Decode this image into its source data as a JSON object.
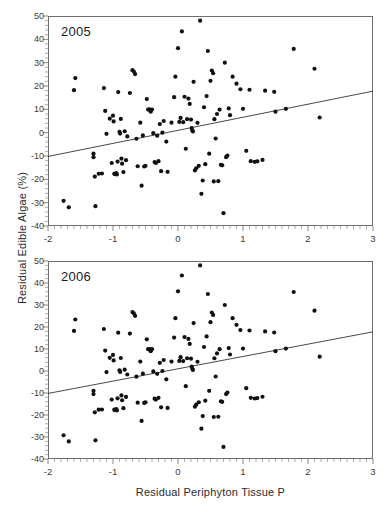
{
  "figure": {
    "axis_x_title": "Residual Periphyton Tissue P",
    "axis_y_title": "Residual Edible Algae (%)",
    "background_color": "#ffffff",
    "marker_color": "#111111",
    "line_color": "#333333",
    "frame_color": "#6e6e6e"
  },
  "chart_data": [
    {
      "type": "scatter",
      "title": "2005",
      "xlabel": "Residual Periphyton Tissue P",
      "ylabel": "Residual Edible Algae (%)",
      "xlim": [
        -2,
        3
      ],
      "ylim": [
        -40,
        50
      ],
      "xticks": [
        -2,
        -1,
        0,
        1,
        2,
        3
      ],
      "yticks": [
        -40,
        -30,
        -20,
        -10,
        0,
        10,
        20,
        30,
        40,
        50
      ],
      "xtick_labels": [
        "-2",
        "-1",
        "0",
        "1",
        "2",
        "3"
      ],
      "ytick_labels": [
        "-40",
        "-30",
        "-20",
        "-10",
        "0",
        "10",
        "20",
        "30",
        "40",
        "50"
      ],
      "grid": false,
      "legend": false,
      "trendline": {
        "x": [
          -2,
          3
        ],
        "y": [
          -10.2,
          17.8
        ]
      },
      "points": [
        [
          -1.76,
          -29.2
        ],
        [
          -1.68,
          -32.0
        ],
        [
          -1.58,
          23.4
        ],
        [
          -1.6,
          18.2
        ],
        [
          -1.3,
          -10.5
        ],
        [
          -1.3,
          -9.0
        ],
        [
          -1.27,
          -31.5
        ],
        [
          -1.28,
          -18.8
        ],
        [
          -1.22,
          -17.6
        ],
        [
          -1.17,
          -17.5
        ],
        [
          -1.14,
          19.1
        ],
        [
          -1.12,
          9.3
        ],
        [
          -1.1,
          -0.5
        ],
        [
          -1.05,
          6.0
        ],
        [
          -1.02,
          -13.0
        ],
        [
          -1.0,
          7.3
        ],
        [
          -0.99,
          4.8
        ],
        [
          -0.98,
          -17.6
        ],
        [
          -0.97,
          -17.8
        ],
        [
          -0.95,
          -17.3
        ],
        [
          -0.94,
          -17.9
        ],
        [
          -0.93,
          -12.4
        ],
        [
          -0.92,
          17.4
        ],
        [
          -0.9,
          0.3
        ],
        [
          -0.89,
          -0.4
        ],
        [
          -0.88,
          5.9
        ],
        [
          -0.87,
          -11.1
        ],
        [
          -0.86,
          -13.3
        ],
        [
          -0.84,
          -16.9
        ],
        [
          -0.82,
          0.6
        ],
        [
          -0.8,
          -11.8
        ],
        [
          -0.78,
          -1.6
        ],
        [
          -0.74,
          17.0
        ],
        [
          -0.7,
          26.8
        ],
        [
          -0.68,
          26.2
        ],
        [
          -0.66,
          25.1
        ],
        [
          -0.64,
          -2.6
        ],
        [
          -0.62,
          -14.4
        ],
        [
          -0.58,
          4.3
        ],
        [
          -0.56,
          -22.7
        ],
        [
          -0.54,
          -1.2
        ],
        [
          -0.52,
          -14.5
        ],
        [
          -0.5,
          -14.2
        ],
        [
          -0.48,
          14.4
        ],
        [
          -0.46,
          9.9
        ],
        [
          -0.44,
          10.0
        ],
        [
          -0.42,
          9.0
        ],
        [
          -0.4,
          9.9
        ],
        [
          -0.38,
          -0.2
        ],
        [
          -0.36,
          -12.6
        ],
        [
          -0.34,
          -13.0
        ],
        [
          -0.32,
          -1.3
        ],
        [
          -0.3,
          -12.2
        ],
        [
          -0.28,
          3.7
        ],
        [
          -0.26,
          -16.5
        ],
        [
          -0.24,
          0.0
        ],
        [
          -0.22,
          5.0
        ],
        [
          -0.18,
          -3.8
        ],
        [
          -0.16,
          -16.8
        ],
        [
          -0.1,
          4.3
        ],
        [
          -0.06,
          15.2
        ],
        [
          -0.04,
          24.0
        ],
        [
          0.0,
          36.2
        ],
        [
          0.02,
          4.6
        ],
        [
          0.04,
          6.3
        ],
        [
          0.06,
          43.4
        ],
        [
          0.08,
          4.5
        ],
        [
          0.1,
          15.4
        ],
        [
          0.12,
          -6.9
        ],
        [
          0.14,
          5.8
        ],
        [
          0.16,
          14.6
        ],
        [
          0.18,
          12.3
        ],
        [
          0.2,
          5.6
        ],
        [
          0.21,
          2.0
        ],
        [
          0.22,
          1.0
        ],
        [
          0.23,
          0.5
        ],
        [
          0.24,
          21.8
        ],
        [
          0.26,
          -16.2
        ],
        [
          0.28,
          -15.3
        ],
        [
          0.3,
          4.2
        ],
        [
          0.32,
          -14.2
        ],
        [
          0.34,
          48.0
        ],
        [
          0.36,
          -26.2
        ],
        [
          0.38,
          -20.5
        ],
        [
          0.4,
          10.9
        ],
        [
          0.42,
          -13.5
        ],
        [
          0.44,
          15.7
        ],
        [
          0.46,
          35.0
        ],
        [
          0.48,
          -9.0
        ],
        [
          0.5,
          22.2
        ],
        [
          0.52,
          26.6
        ],
        [
          0.54,
          25.5
        ],
        [
          0.55,
          -20.9
        ],
        [
          0.56,
          5.8
        ],
        [
          0.58,
          -2.5
        ],
        [
          0.6,
          8.0
        ],
        [
          0.62,
          -20.8
        ],
        [
          0.64,
          9.9
        ],
        [
          0.66,
          -13.8
        ],
        [
          0.68,
          -14.0
        ],
        [
          0.7,
          -34.5
        ],
        [
          0.72,
          30.0
        ],
        [
          0.74,
          -10.5
        ],
        [
          0.76,
          -9.8
        ],
        [
          0.78,
          10.4
        ],
        [
          0.8,
          7.5
        ],
        [
          0.84,
          24.0
        ],
        [
          0.9,
          21.0
        ],
        [
          0.96,
          18.6
        ],
        [
          1.0,
          10.2
        ],
        [
          1.05,
          -7.8
        ],
        [
          1.1,
          18.4
        ],
        [
          1.12,
          -12.2
        ],
        [
          1.18,
          -12.5
        ],
        [
          1.22,
          -12.3
        ],
        [
          1.3,
          -11.7
        ],
        [
          1.34,
          18.0
        ],
        [
          1.48,
          17.5
        ],
        [
          1.5,
          9.0
        ],
        [
          1.66,
          10.2
        ],
        [
          1.78,
          35.9
        ],
        [
          2.1,
          27.4
        ],
        [
          2.18,
          6.5
        ]
      ]
    },
    {
      "type": "scatter",
      "title": "2006",
      "xlabel": "Residual Periphyton Tissue P",
      "ylabel": "Residual Edible Algae (%)",
      "xlim": [
        -2,
        3
      ],
      "ylim": [
        -40,
        50
      ],
      "xticks": [
        -2,
        -1,
        0,
        1,
        2,
        3
      ],
      "yticks": [
        -40,
        -30,
        -20,
        -10,
        0,
        10,
        20,
        30,
        40,
        50
      ],
      "xtick_labels": [
        "-2",
        "-1",
        "0",
        "1",
        "2",
        "3"
      ],
      "ytick_labels": [
        "-40",
        "-30",
        "-20",
        "-10",
        "0",
        "10",
        "20",
        "30",
        "40",
        "50"
      ],
      "grid": false,
      "legend": false,
      "trendline": {
        "x": [
          -2,
          3
        ],
        "y": [
          -10.2,
          17.8
        ]
      },
      "points": [
        [
          -1.76,
          -29.2
        ],
        [
          -1.68,
          -32.0
        ],
        [
          -1.58,
          23.4
        ],
        [
          -1.6,
          18.2
        ],
        [
          -1.3,
          -10.5
        ],
        [
          -1.3,
          -9.0
        ],
        [
          -1.27,
          -31.5
        ],
        [
          -1.28,
          -18.8
        ],
        [
          -1.22,
          -17.6
        ],
        [
          -1.17,
          -17.5
        ],
        [
          -1.14,
          19.1
        ],
        [
          -1.12,
          9.3
        ],
        [
          -1.1,
          -0.5
        ],
        [
          -1.05,
          6.0
        ],
        [
          -1.02,
          -13.0
        ],
        [
          -1.0,
          7.3
        ],
        [
          -0.99,
          4.8
        ],
        [
          -0.98,
          -17.6
        ],
        [
          -0.97,
          -17.8
        ],
        [
          -0.95,
          -17.3
        ],
        [
          -0.94,
          -17.9
        ],
        [
          -0.93,
          -12.4
        ],
        [
          -0.92,
          17.4
        ],
        [
          -0.9,
          0.3
        ],
        [
          -0.89,
          -0.4
        ],
        [
          -0.88,
          5.9
        ],
        [
          -0.87,
          -11.1
        ],
        [
          -0.86,
          -13.3
        ],
        [
          -0.84,
          -16.9
        ],
        [
          -0.82,
          0.6
        ],
        [
          -0.8,
          -11.8
        ],
        [
          -0.78,
          -1.6
        ],
        [
          -0.74,
          17.0
        ],
        [
          -0.7,
          26.8
        ],
        [
          -0.68,
          26.2
        ],
        [
          -0.66,
          25.1
        ],
        [
          -0.64,
          -2.6
        ],
        [
          -0.62,
          -14.4
        ],
        [
          -0.58,
          4.3
        ],
        [
          -0.56,
          -22.7
        ],
        [
          -0.54,
          -1.2
        ],
        [
          -0.52,
          -14.5
        ],
        [
          -0.5,
          -14.2
        ],
        [
          -0.48,
          14.4
        ],
        [
          -0.46,
          9.9
        ],
        [
          -0.44,
          10.0
        ],
        [
          -0.42,
          9.0
        ],
        [
          -0.4,
          9.9
        ],
        [
          -0.38,
          -0.2
        ],
        [
          -0.36,
          -12.6
        ],
        [
          -0.34,
          -13.0
        ],
        [
          -0.32,
          -1.3
        ],
        [
          -0.3,
          -12.2
        ],
        [
          -0.28,
          3.7
        ],
        [
          -0.26,
          -16.5
        ],
        [
          -0.24,
          0.0
        ],
        [
          -0.22,
          5.0
        ],
        [
          -0.18,
          -3.8
        ],
        [
          -0.16,
          -16.8
        ],
        [
          -0.1,
          4.3
        ],
        [
          -0.06,
          15.2
        ],
        [
          -0.04,
          24.0
        ],
        [
          0.0,
          36.2
        ],
        [
          0.02,
          4.6
        ],
        [
          0.04,
          6.3
        ],
        [
          0.06,
          43.4
        ],
        [
          0.08,
          4.5
        ],
        [
          0.1,
          15.4
        ],
        [
          0.12,
          -6.9
        ],
        [
          0.14,
          5.8
        ],
        [
          0.16,
          14.6
        ],
        [
          0.18,
          12.3
        ],
        [
          0.2,
          5.6
        ],
        [
          0.21,
          2.0
        ],
        [
          0.22,
          1.0
        ],
        [
          0.23,
          0.5
        ],
        [
          0.24,
          21.8
        ],
        [
          0.26,
          -16.2
        ],
        [
          0.28,
          -15.3
        ],
        [
          0.3,
          4.2
        ],
        [
          0.32,
          -14.2
        ],
        [
          0.34,
          48.0
        ],
        [
          0.36,
          -26.2
        ],
        [
          0.38,
          -20.5
        ],
        [
          0.4,
          10.9
        ],
        [
          0.42,
          -13.5
        ],
        [
          0.44,
          15.7
        ],
        [
          0.46,
          35.0
        ],
        [
          0.48,
          -9.0
        ],
        [
          0.5,
          22.2
        ],
        [
          0.52,
          26.6
        ],
        [
          0.54,
          25.5
        ],
        [
          0.55,
          -20.9
        ],
        [
          0.56,
          5.8
        ],
        [
          0.58,
          -2.5
        ],
        [
          0.6,
          8.0
        ],
        [
          0.62,
          -20.8
        ],
        [
          0.64,
          9.9
        ],
        [
          0.66,
          -13.8
        ],
        [
          0.68,
          -14.0
        ],
        [
          0.7,
          -34.5
        ],
        [
          0.72,
          30.0
        ],
        [
          0.74,
          -10.5
        ],
        [
          0.76,
          -9.8
        ],
        [
          0.78,
          10.4
        ],
        [
          0.8,
          7.5
        ],
        [
          0.84,
          24.0
        ],
        [
          0.9,
          21.0
        ],
        [
          0.96,
          18.6
        ],
        [
          1.0,
          10.2
        ],
        [
          1.05,
          -7.8
        ],
        [
          1.1,
          18.4
        ],
        [
          1.12,
          -12.2
        ],
        [
          1.18,
          -12.5
        ],
        [
          1.22,
          -12.3
        ],
        [
          1.3,
          -11.7
        ],
        [
          1.34,
          18.0
        ],
        [
          1.48,
          17.5
        ],
        [
          1.5,
          9.0
        ],
        [
          1.66,
          10.2
        ],
        [
          1.78,
          35.9
        ],
        [
          2.1,
          27.4
        ],
        [
          2.18,
          6.5
        ]
      ]
    }
  ]
}
